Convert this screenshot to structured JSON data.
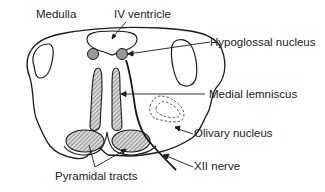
{
  "figure": {
    "title": "Medulla",
    "labels": {
      "iv_ventricle": "IV ventricle",
      "hypoglossal_nucleus": "Hypoglossal nucleus",
      "medial_lemniscus": "Medial lemniscus",
      "olivary_nucleus": "Olivary nucleus",
      "xii_nerve": "XII nerve",
      "pyramidal_tracts": "Pyramidal tracts"
    },
    "colors": {
      "stroke": "#1a1a1a",
      "nucleus_fill": "#9a9a9a",
      "hatch": "#555555",
      "background": "#ffffff"
    }
  }
}
